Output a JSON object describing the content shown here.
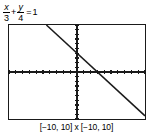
{
  "equation": {
    "label": "x/3 + y/4 = 1",
    "term1": {
      "numerator": "x",
      "denominator": "3"
    },
    "operator": "+",
    "term2": {
      "numerator": "y",
      "denominator": "4"
    },
    "equals": "=",
    "right_side": "1"
  },
  "window_caption": "[−10, 10] x [−10, 10]",
  "colors": {
    "ink": "#1a1a1a",
    "background": "#ffffff",
    "curve": "#1a1a1a"
  },
  "chart_data": {
    "type": "line",
    "xlabel": "",
    "ylabel": "",
    "xlim": [
      -10,
      10
    ],
    "ylim": [
      -10,
      10
    ],
    "grid": false,
    "legend": "none",
    "x_tick_interval": 1,
    "y_tick_interval": 1,
    "axes": {
      "x_axis_visible": true,
      "y_axis_visible": true,
      "tick_marks": true
    },
    "series": [
      {
        "name": "x/3 + y/4 = 1",
        "equation_slope": -1.3333,
        "equation_intercept": 4,
        "x_intercept": 3,
        "y_intercept": 4,
        "x": [
          -4.5,
          10
        ],
        "y": [
          10,
          -9.3333
        ]
      }
    ],
    "annotations": [
      "[−10, 10] x [−10, 10]"
    ]
  }
}
